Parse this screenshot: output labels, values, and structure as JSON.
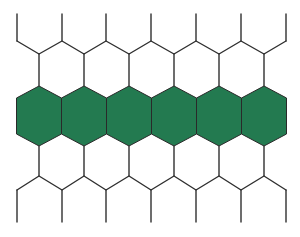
{
  "diagram": {
    "type": "hexagonal-grid",
    "colors": {
      "background": "#ffffff",
      "highlight_fill": "#237a50",
      "line": "#2f2f2f"
    },
    "highlighted_row": {
      "count": 6,
      "centers_x": [
        39,
        84,
        129,
        174,
        219,
        264
      ],
      "top_apex_y": 86,
      "upper_shoulder_y": 98,
      "lower_shoulder_y": 134,
      "bottom_apex_y": 146,
      "half_width": 22.5
    },
    "top_lattice": {
      "verticals_x": [
        17,
        62,
        106,
        151,
        196,
        241,
        286
      ],
      "vertical_top_y": 14,
      "vertical_bottom_y": 41,
      "valley_y": 54,
      "valley_x": [
        39,
        84,
        129,
        174,
        219,
        264
      ]
    },
    "bottom_lattice": {
      "verticals_x": [
        17,
        62,
        106,
        151,
        196,
        241,
        286
      ],
      "peak_y": 176,
      "vertical_top_y": 190,
      "vertical_bottom_y": 222,
      "peak_x": [
        39,
        84,
        129,
        174,
        219,
        264
      ]
    }
  }
}
